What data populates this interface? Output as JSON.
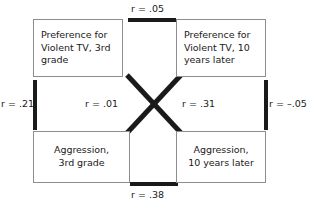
{
  "diagram": {
    "type": "cross-lagged-panel-correlation",
    "boxes": {
      "top_left": {
        "line1": "Preference for",
        "line2": "Violent TV, 3rd",
        "line3": "grade"
      },
      "top_right": {
        "line1": "Preference for",
        "line2": "Violent TV, 10",
        "line3": "years later"
      },
      "bottom_left": {
        "line1": "Aggression,",
        "line2": "3rd grade"
      },
      "bottom_right": {
        "line1": "Aggression,",
        "line2": "10 years later"
      }
    },
    "correlations": {
      "top": "r = .05",
      "bottom": "r = .38",
      "left": "r = .21",
      "right": "r = –.05",
      "diagonal_left": "r = .01",
      "diagonal_right": "r = .31"
    },
    "colors": {
      "line": "#1a1a1a",
      "box_border": "#8d8d8d",
      "background": "#ffffff",
      "text": "#1a1a1a"
    }
  }
}
